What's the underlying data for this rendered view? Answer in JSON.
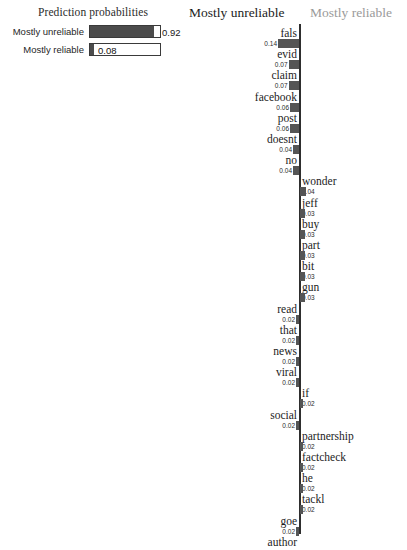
{
  "probabilities": {
    "title": "Prediction probabilities",
    "rows": [
      {
        "label": "Mostly unreliable",
        "value": "0.92",
        "fraction": 0.92
      },
      {
        "label": "Mostly reliable",
        "value": "0.08",
        "fraction": 0.08
      }
    ],
    "bar_color": "#4c4c4c",
    "track_border_color": "#3a3a3a"
  },
  "classes": {
    "negative_label": "Mostly unreliable",
    "positive_label": "Mostly reliable",
    "negative_color": "#1c1c1c",
    "positive_color": "#9a9a9a"
  },
  "chart_data": {
    "type": "bar",
    "title": "",
    "xlabel": "",
    "ylabel": "",
    "orientation": "horizontal-diverging",
    "axis_center": 0,
    "grid": false,
    "legend": [
      "Mostly unreliable",
      "Mostly reliable"
    ],
    "categories": [
      "fals",
      "evid",
      "claim",
      "facebook",
      "post",
      "doesnt",
      "no",
      "wonder",
      "jeff",
      "buy",
      "part",
      "bit",
      "gun",
      "read",
      "that",
      "news",
      "viral",
      "if",
      "social",
      "partnership",
      "factcheck",
      "he",
      "tackl",
      "goe",
      "author"
    ],
    "values": [
      -0.14,
      -0.07,
      -0.07,
      -0.06,
      -0.06,
      -0.04,
      -0.04,
      0.04,
      0.03,
      0.03,
      0.03,
      0.03,
      0.03,
      -0.02,
      -0.02,
      -0.02,
      -0.02,
      0.02,
      -0.02,
      0.02,
      0.02,
      0.02,
      0.02,
      -0.02,
      null
    ],
    "value_labels": [
      "0.14",
      "0.07",
      "0.07",
      "0.06",
      "0.06",
      "0.04",
      "0.04",
      "0.04",
      "0.03",
      "0.03",
      "0.03",
      "0.03",
      "0.03",
      "0.02",
      "0.02",
      "0.02",
      "0.02",
      "0.02",
      "0.02",
      "0.02",
      "0.02",
      "0.02",
      "0.02",
      "0.02",
      ""
    ],
    "sides": [
      "left",
      "left",
      "left",
      "left",
      "left",
      "left",
      "left",
      "right",
      "right",
      "right",
      "right",
      "right",
      "right",
      "left",
      "left",
      "left",
      "left",
      "right",
      "left",
      "right",
      "right",
      "right",
      "right",
      "left",
      "left"
    ],
    "bar_color": "#555555",
    "axis_color": "#2e2e2e"
  }
}
